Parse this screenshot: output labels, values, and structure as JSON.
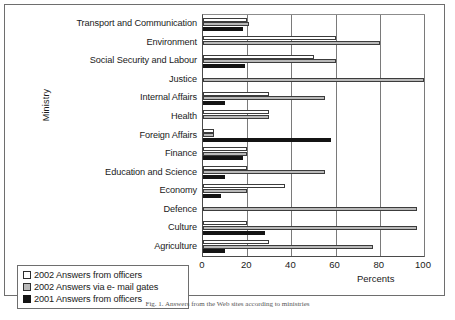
{
  "chart_data": {
    "type": "bar",
    "orientation": "horizontal",
    "title": "",
    "xlabel": "Percents",
    "ylabel": "Ministry",
    "xlim": [
      0,
      100
    ],
    "xticks": [
      0,
      20,
      40,
      60,
      80,
      100
    ],
    "grid": true,
    "legend_position": "bottom-left",
    "categories": [
      "Transport and Communication",
      "Environment",
      "Social Security and Labour",
      "Justice",
      "Internal Affairs",
      "Health",
      "Foreign Affairs",
      "Finance",
      "Education and Science",
      "Economy",
      "Defence",
      "Culture",
      "Agriculture"
    ],
    "series": [
      {
        "name": "2002 Answers from officers",
        "key": "w",
        "color": "#ffffff",
        "values": [
          20,
          60,
          50,
          0,
          30,
          30,
          5,
          20,
          20,
          37,
          0,
          20,
          30
        ]
      },
      {
        "name": "2002 Answers via e- mail gates",
        "key": "g",
        "color": "#b9b9b9",
        "values": [
          21,
          80,
          60,
          100,
          55,
          30,
          5,
          20,
          55,
          20,
          97,
          97,
          77
        ]
      },
      {
        "name": "2001 Answers from officers",
        "key": "k",
        "color": "#141414",
        "values": [
          18,
          0,
          19,
          0,
          10,
          0,
          58,
          18,
          10,
          8,
          0,
          28,
          10
        ]
      }
    ]
  },
  "axes": {
    "ylabel": "Ministry",
    "xlabel": "Percents",
    "xticks": [
      "0",
      "20",
      "40",
      "60",
      "80",
      "100"
    ]
  },
  "legend": {
    "items": [
      {
        "label": "2002 Answers from officers",
        "swatch": "w"
      },
      {
        "label": "2002 Answers via e- mail gates",
        "swatch": "g"
      },
      {
        "label": "2001 Answers from officers",
        "swatch": "k"
      }
    ]
  },
  "caption": "Fig. 1. Answers from the Web sites according to ministries"
}
